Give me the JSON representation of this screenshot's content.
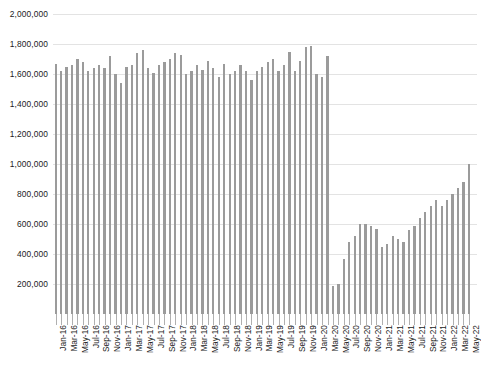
{
  "chart_data": {
    "type": "bar",
    "title": "",
    "subtitle": "",
    "xlabel": "",
    "ylabel": "",
    "ylim": [
      0,
      2000000
    ],
    "ytick_step": 200000,
    "grid": true,
    "legend": false,
    "legend_position": "none",
    "bar_color": "#9b9b9b",
    "gridline_color": "#e3e3e3",
    "axis_text_color": "#1a1a1a",
    "ytick_labels": [
      "2,000,000",
      "1,800,000",
      "1,600,000",
      "1,400,000",
      "1,200,000",
      "1,000,000",
      "800,000",
      "600,000",
      "400,000",
      "200,000"
    ],
    "ytick_values": [
      2000000,
      1800000,
      1600000,
      1400000,
      1200000,
      1000000,
      800000,
      600000,
      400000,
      200000
    ],
    "xtick_labels": [
      "Jan-16",
      "Mar-16",
      "May-16",
      "Jul-16",
      "Sep-16",
      "Nov-16",
      "Jan-17",
      "Mar-17",
      "May-17",
      "Jul-17",
      "Sep-17",
      "Nov-17",
      "Jan-18",
      "Mar-18",
      "May-18",
      "Jul-18",
      "Sep-18",
      "Nov-18",
      "Jan-19",
      "Mar-19",
      "May-19",
      "Jul-19",
      "Sep-19",
      "Nov-19",
      "Jan-20",
      "Mar-20",
      "May-20",
      "Jul-20",
      "Sep-20",
      "Nov-20",
      "Jan-21",
      "Mar-21",
      "May-21",
      "Jul-21",
      "Sep-21",
      "Nov-21",
      "Jan-22",
      "Mar-22",
      "May-22"
    ],
    "xtick_label_interval": 2,
    "categories": [
      "Jan-16",
      "Feb-16",
      "Mar-16",
      "Apr-16",
      "May-16",
      "Jun-16",
      "Jul-16",
      "Aug-16",
      "Sep-16",
      "Oct-16",
      "Nov-16",
      "Dec-16",
      "Jan-17",
      "Feb-17",
      "Mar-17",
      "Apr-17",
      "May-17",
      "Jun-17",
      "Jul-17",
      "Aug-17",
      "Sep-17",
      "Oct-17",
      "Nov-17",
      "Dec-17",
      "Jan-18",
      "Feb-18",
      "Mar-18",
      "Apr-18",
      "May-18",
      "Jun-18",
      "Jul-18",
      "Aug-18",
      "Sep-18",
      "Oct-18",
      "Nov-18",
      "Dec-18",
      "Jan-19",
      "Feb-19",
      "Mar-19",
      "Apr-19",
      "May-19",
      "Jun-19",
      "Jul-19",
      "Aug-19",
      "Sep-19",
      "Oct-19",
      "Nov-19",
      "Dec-19",
      "Jan-20",
      "Feb-20",
      "Mar-20",
      "Apr-20",
      "May-20",
      "Jun-20",
      "Jul-20",
      "Aug-20",
      "Sep-20",
      "Oct-20",
      "Nov-20",
      "Dec-20",
      "Jan-21",
      "Feb-21",
      "Mar-21",
      "Apr-21",
      "May-21",
      "Jun-21",
      "Jul-21",
      "Aug-21",
      "Sep-21",
      "Oct-21",
      "Nov-21",
      "Dec-21",
      "Jan-22",
      "Feb-22",
      "Mar-22",
      "Apr-22",
      "May-22"
    ],
    "values": [
      1670000,
      1620000,
      1650000,
      1660000,
      1700000,
      1680000,
      1620000,
      1640000,
      1660000,
      1640000,
      1720000,
      1600000,
      1540000,
      1650000,
      1660000,
      1740000,
      1760000,
      1640000,
      1610000,
      1660000,
      1680000,
      1700000,
      1740000,
      1730000,
      1600000,
      1620000,
      1660000,
      1630000,
      1690000,
      1640000,
      1580000,
      1670000,
      1600000,
      1620000,
      1660000,
      1620000,
      1560000,
      1620000,
      1650000,
      1680000,
      1700000,
      1620000,
      1660000,
      1750000,
      1620000,
      1690000,
      1780000,
      1790000,
      1600000,
      1580000,
      1720000,
      190000,
      200000,
      370000,
      480000,
      520000,
      600000,
      600000,
      590000,
      570000,
      450000,
      470000,
      520000,
      500000,
      480000,
      560000,
      590000,
      640000,
      680000,
      720000,
      760000,
      720000,
      760000,
      800000,
      840000,
      880000,
      1000000
    ]
  }
}
